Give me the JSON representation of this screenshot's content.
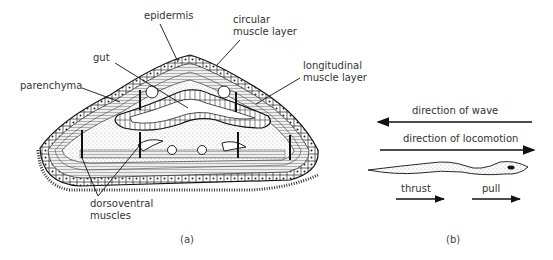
{
  "panel_a": {
    "caption": "(a)",
    "labels": {
      "epidermis": "epidermis",
      "circular_1": "circular",
      "circular_2": "muscle layer",
      "gut": "gut",
      "longitudinal_1": "longitudinal",
      "longitudinal_2": "muscle layer",
      "parenchyma": "parenchyma",
      "dorsoventral_1": "dorsoventral",
      "dorsoventral_2": "muscles"
    }
  },
  "panel_b": {
    "caption": "(b)",
    "labels": {
      "wave": "direction of wave",
      "locomotion": "direction of locomotion",
      "thrust": "thrust",
      "pull": "pull"
    }
  }
}
